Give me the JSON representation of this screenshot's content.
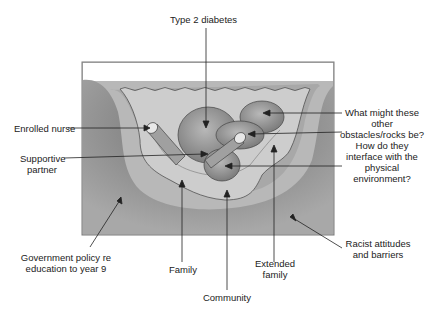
{
  "diagram": {
    "type": "river-metaphor",
    "labels": {
      "type2_diabetes": "Type 2 diabetes",
      "enrolled_nurse": "Enrolled nurse",
      "supportive_partner_1": "Supportive",
      "supportive_partner_2": "partner",
      "question_1": "What might these",
      "question_2": "other",
      "question_3": "obstacles/rocks be?",
      "question_4": "How do they",
      "question_5": "interface with the",
      "question_6": "physical",
      "question_7": "environment?",
      "government_1": "Government policy re",
      "government_2": "education to year 9",
      "family": "Family",
      "community": "Community",
      "extended_1": "Extended",
      "extended_2": "family",
      "racist_1": "Racist attitudes",
      "racist_2": "and barriers"
    },
    "colors": {
      "frame": "#7a7a7a",
      "water": "#d0d0d0",
      "riverbed": "#bdbdbd",
      "bank": "#8c8c8c",
      "rock": "#9a9a9a",
      "line": "#222222"
    }
  }
}
